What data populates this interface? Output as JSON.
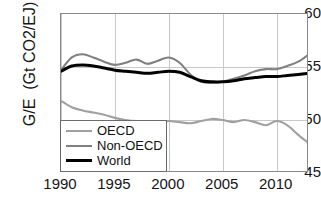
{
  "chart_data": {
    "type": "line",
    "title": "",
    "xlabel": "",
    "ylabel": "G/E  (Gt CO2/EJ)",
    "xlim": [
      1990,
      2013
    ],
    "ylim": [
      45,
      60
    ],
    "grid": true,
    "legend_position": "lower-left-inside",
    "xticks": [
      "1990",
      "1995",
      "2000",
      "2005",
      "2010"
    ],
    "xtick_values": [
      1990,
      1995,
      2000,
      2005,
      2010
    ],
    "yticks": [
      "45",
      "50",
      "55",
      "60"
    ],
    "ytick_values": [
      45,
      50,
      55,
      60
    ],
    "x": [
      1990,
      1991,
      1992,
      1993,
      1994,
      1995,
      1996,
      1997,
      1998,
      1999,
      2000,
      2001,
      2002,
      2003,
      2004,
      2005,
      2006,
      2007,
      2008,
      2009,
      2010,
      2011,
      2012,
      2013
    ],
    "series": [
      {
        "name": "OECD",
        "color": "#a0a0a0",
        "values": [
          51.8,
          51.2,
          50.9,
          50.7,
          50.5,
          50.2,
          50.0,
          49.9,
          49.9,
          49.8,
          49.9,
          49.8,
          49.7,
          49.9,
          50.1,
          50.0,
          49.8,
          50.0,
          49.8,
          49.5,
          49.9,
          49.5,
          48.6,
          47.8
        ]
      },
      {
        "name": "Non-OECD",
        "color": "#808080",
        "values": [
          54.7,
          55.9,
          56.2,
          55.9,
          55.5,
          55.2,
          55.4,
          55.7,
          55.3,
          55.6,
          55.9,
          55.4,
          54.3,
          53.6,
          53.5,
          53.6,
          53.9,
          54.2,
          54.6,
          54.8,
          54.8,
          55.1,
          55.5,
          56.2
        ]
      },
      {
        "name": "World",
        "color": "#000000",
        "values": [
          54.6,
          55.1,
          55.2,
          55.1,
          54.9,
          54.7,
          54.6,
          54.5,
          54.4,
          54.5,
          54.6,
          54.5,
          54.1,
          53.7,
          53.6,
          53.6,
          53.7,
          53.9,
          54.0,
          54.1,
          54.1,
          54.2,
          54.3,
          54.4
        ]
      }
    ]
  },
  "legend": {
    "items": [
      {
        "label": "OECD",
        "color": "#a0a0a0",
        "width": 2.1
      },
      {
        "label": "Non-OECD",
        "color": "#808080",
        "width": 2.1
      },
      {
        "label": "World",
        "color": "#000000",
        "width": 3.0
      }
    ]
  }
}
